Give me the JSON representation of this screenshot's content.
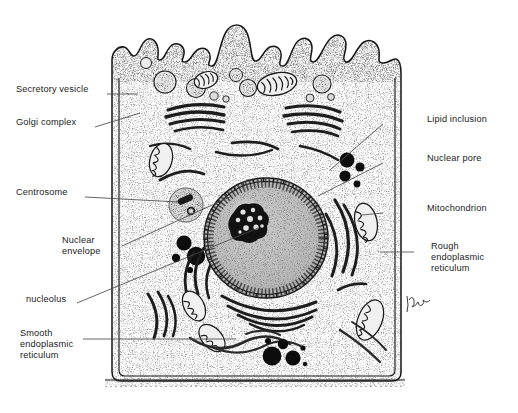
{
  "figure": {
    "signature": "Bingham",
    "caption": "",
    "colors": {
      "ink": "#1b1b1b",
      "leader": "#4a4a4a",
      "cytoplasm": "#fdfdfd",
      "nucleoplasm": "#bdbdbd",
      "nucleolus": "#141414",
      "organelle_dark": "#232323",
      "lipid": "#0d0d0d",
      "basal_lamina": "#2a2a2a"
    }
  },
  "labels_left": [
    {
      "id": "secretory-vesicle",
      "text": "Secretory vesicle",
      "x": 16,
      "y": 89,
      "leader": [
        [
          107,
          94
        ],
        [
          138,
          94
        ]
      ]
    },
    {
      "id": "golgi-complex",
      "text": "Golgi complex",
      "x": 16,
      "y": 122,
      "leader": [
        [
          95,
          127
        ],
        [
          140,
          113
        ]
      ]
    },
    {
      "id": "centrosome",
      "text": "Centrosome",
      "x": 16,
      "y": 192,
      "leader": [
        [
          85,
          197
        ],
        [
          178,
          202
        ]
      ]
    },
    {
      "id": "nuclear-envelope",
      "text": "Nuclear\nenvelope",
      "x": 62,
      "y": 241,
      "leader": [
        [
          122,
          246
        ],
        [
          232,
          196
        ]
      ]
    },
    {
      "id": "nucleolus",
      "text": "nucleolus",
      "x": 26,
      "y": 299,
      "leader": [
        [
          77,
          303
        ],
        [
          258,
          228
        ]
      ]
    },
    {
      "id": "smooth-endoplasmic-reticulum",
      "text": "Smooth\nendoplasmic\nreticulum",
      "x": 20,
      "y": 334,
      "leader": [
        [
          83,
          339
        ],
        [
          236,
          339
        ]
      ]
    }
  ],
  "labels_right": [
    {
      "id": "lipid-inclusion",
      "text": "Lipid inclusion",
      "x": 427,
      "y": 119,
      "leader": [
        [
          383,
          124
        ],
        [
          330,
          170
        ]
      ]
    },
    {
      "id": "nuclear-pore",
      "text": "Nuclear pore",
      "x": 427,
      "y": 158,
      "leader": [
        [
          383,
          163
        ],
        [
          318,
          196
        ]
      ]
    },
    {
      "id": "mitochondrion",
      "text": "Mitochondrion",
      "x": 427,
      "y": 208,
      "leader": [
        [
          383,
          213
        ],
        [
          365,
          215
        ]
      ]
    },
    {
      "id": "rough-endoplasmic-reticulum",
      "text": "Rough\nendoplasmic\nreticulum",
      "x": 431,
      "y": 247,
      "leader": [
        [
          414,
          252
        ],
        [
          380,
          252
        ]
      ]
    }
  ],
  "structures": {
    "cell_membrane": "plasma membrane with apical microvilli",
    "nucleus": "large round nucleus, center",
    "nucleolus": "dark irregular nucleolus inside nucleus",
    "basal_lamina": "dark stippled band along cell base",
    "mitochondria_count": 9,
    "lipid_droplet_count": 9,
    "golgi_stack_count": 3,
    "secretory_vesicle_count": 8
  }
}
